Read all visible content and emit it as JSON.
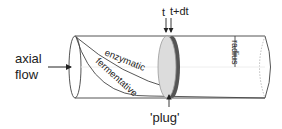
{
  "diagram": {
    "labels": {
      "axial_line1": "axial",
      "axial_line2": "flow",
      "enzymatic": "enzymatic",
      "fermentative": "fermentative",
      "t": "t",
      "t_dt": "t+dt",
      "radius": "radius",
      "plug": "'plug'"
    },
    "colors": {
      "outline": "#555555",
      "plug_face": "#dcdcdc",
      "plug_rim": "#555555",
      "text": "#222222",
      "axis_dotted": "#aaaaaa"
    }
  }
}
